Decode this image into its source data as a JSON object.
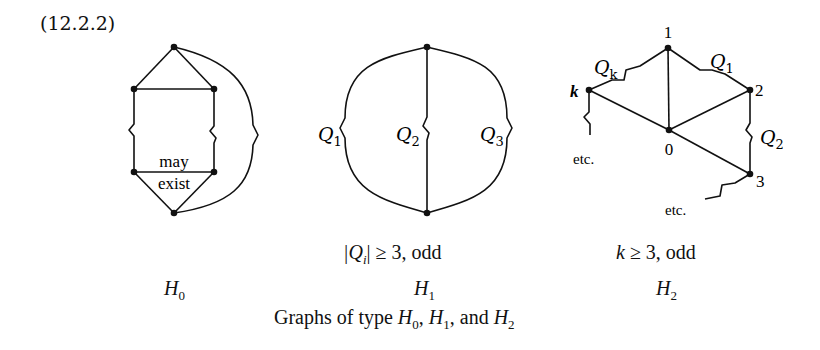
{
  "equation_number": "(12.2.2)",
  "graphs": {
    "H0": {
      "name": "H",
      "sub": "0",
      "condition": "",
      "inner_label_line1": "may",
      "inner_label_line2": "exist"
    },
    "H1": {
      "name": "H",
      "sub": "1",
      "condition_prefix": "|Q",
      "condition_sub": "i",
      "condition_suffix": "| ≥ 3, odd",
      "path_labels": [
        {
          "name": "Q",
          "sub": "1"
        },
        {
          "name": "Q",
          "sub": "2"
        },
        {
          "name": "Q",
          "sub": "3"
        }
      ]
    },
    "H2": {
      "name": "H",
      "sub": "2",
      "condition_var": "k",
      "condition_suffix": " ≥ 3, odd",
      "node_labels": {
        "n0": "0",
        "n1": "1",
        "n2": "2",
        "n3": "3",
        "nk": "k"
      },
      "path_labels": [
        {
          "name": "Q",
          "sub": "k"
        },
        {
          "name": "Q",
          "sub": "1"
        },
        {
          "name": "Q",
          "sub": "2"
        }
      ],
      "etc_labels": [
        "etc.",
        "etc."
      ]
    }
  },
  "caption": {
    "prefix": "Graphs of type ",
    "h0": "H",
    "h0_sub": "0",
    "sep1": ", ",
    "h1": "H",
    "h1_sub": "1",
    "sep2": ", and ",
    "h2": "H",
    "h2_sub": "2"
  }
}
